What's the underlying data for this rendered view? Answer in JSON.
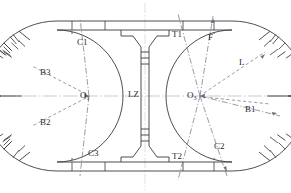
{
  "figure": {
    "type": "engineering-cross-section",
    "colors": {
      "outline": "#3a3a42",
      "centerline": "#9a9aa2",
      "dashdot": "#6e6e78",
      "label": "#2b2b33",
      "background": "#ffffff"
    }
  },
  "labels": {
    "center_left": "O",
    "center_left_sub": "1",
    "center_right": "O",
    "center_right_sub": "3",
    "partition": "LZ",
    "b1": "B1",
    "b2": "B2",
    "b3": "B3",
    "c1": "C1",
    "c2": "C2",
    "c3": "C3",
    "t1": "T1",
    "t2": "T2",
    "f": "F",
    "l": "L"
  },
  "geometry": {
    "outer_ring": "stadium oval, double-line lining",
    "ring_thickness_px": 9,
    "partition_wall": "vertical, centered, flared at top and bottom",
    "radial_joints_count": 16,
    "centers": [
      {
        "name": "O1",
        "x": 89,
        "y": 96
      },
      {
        "name": "O3",
        "x": 200,
        "y": 96
      }
    ]
  }
}
